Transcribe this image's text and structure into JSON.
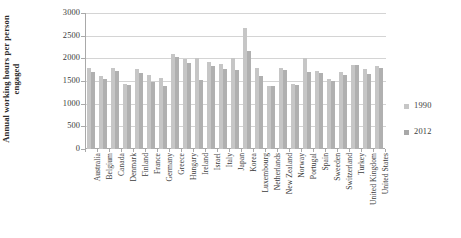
{
  "chart_data": {
    "type": "bar",
    "title": "",
    "xlabel": "",
    "ylabel": "Annual working hours per person engaged",
    "ylabel_line1": "Annual working hours per person",
    "ylabel_line2": "engaged",
    "ylim": [
      0,
      3000
    ],
    "yticks": [
      0,
      500,
      1000,
      1500,
      2000,
      2500,
      3000
    ],
    "ytick_labels": [
      "0",
      "500",
      "1000",
      "1500",
      "2000",
      "2500",
      "3000"
    ],
    "grid": true,
    "legend_position": "right",
    "categories": [
      "Australia",
      "Belgium",
      "Canada",
      "Denmark",
      "Finland",
      "France",
      "Germany",
      "Greece",
      "Hungary",
      "Ireland",
      "Israel",
      "Italy",
      "Japan",
      "Korea",
      "Luxembourg",
      "Netherlands",
      "New Zealand",
      "Norway",
      "Portugal",
      "Spain",
      "Sweeden",
      "Switzerland",
      "Turkey",
      "United Kingdom",
      "United States"
    ],
    "series": [
      {
        "name": "1990",
        "color": "#c6c6c6",
        "values": [
          1780,
          1620,
          1790,
          1425,
          1760,
          1640,
          1560,
          2085,
          1980,
          2010,
          1915,
          1870,
          2015,
          2675,
          1790,
          1390,
          1790,
          1440,
          2010,
          1725,
          1555,
          1695,
          1855,
          1775,
          1830
        ]
      },
      {
        "name": "2012",
        "color": "#b0b0b0",
        "values": [
          1690,
          1555,
          1710,
          1410,
          1685,
          1480,
          1400,
          2035,
          1895,
          1520,
          1825,
          1755,
          1735,
          2160,
          1615,
          1380,
          1735,
          1420,
          1690,
          1680,
          1500,
          1625,
          1855,
          1655,
          1795
        ]
      }
    ]
  },
  "legend": {
    "items": [
      {
        "label": "1990"
      },
      {
        "label": "2012"
      }
    ]
  }
}
